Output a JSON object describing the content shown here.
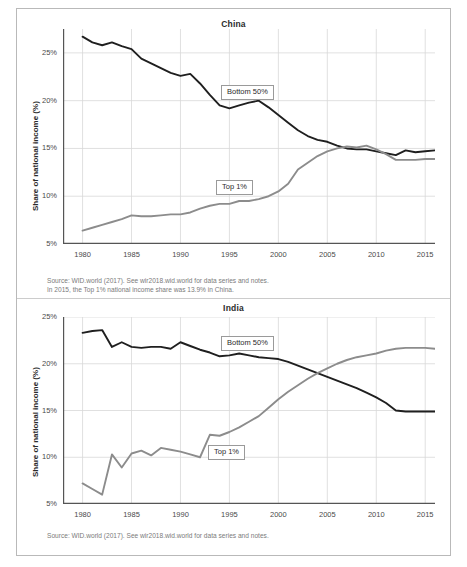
{
  "figure": {
    "background": "#ffffff",
    "border_color": "#b9b9b9"
  },
  "colors": {
    "bottom50": "#1f1f1f",
    "top1": "#8c8c8c",
    "grid": "#d8d8d8",
    "axis": "#555555",
    "text": "#3d3d3d",
    "source_text": "#7b7b7b"
  },
  "panels": {
    "china": {
      "title": "China",
      "ylabel": "Share of national income (%)",
      "source_line_1": "Source: WID.world (2017). See wir2018.wid.world for data series and notes.",
      "source_line_2": "In 2015, the Top 1% national income share was 13.9% in China.",
      "legend": {
        "bottom50": "Bottom 50%",
        "top1": "Top 1%"
      }
    },
    "india": {
      "title": "India",
      "ylabel": "Share of national income (%)",
      "source_line_1": "Source: WID.world (2017). See wir2018.wid.world for data series and notes.",
      "legend": {
        "bottom50": "Bottom 50%",
        "top1": "Top 1%"
      }
    }
  },
  "chart_data": [
    {
      "type": "line",
      "title": "China",
      "xlabel": "",
      "ylabel": "Share of national income (%)",
      "xlim": [
        1978,
        2016
      ],
      "ylim": [
        5,
        27.5
      ],
      "ytick_labels": [
        "5%",
        "10%",
        "15%",
        "20%",
        "25%"
      ],
      "ytick_values": [
        5,
        10,
        15,
        20,
        25
      ],
      "xtick_labels": [
        "1980",
        "1985",
        "1990",
        "1995",
        "2000",
        "2005",
        "2010",
        "2015"
      ],
      "xtick_values": [
        1980,
        1985,
        1990,
        1995,
        2000,
        2005,
        2010,
        2015
      ],
      "grid": true,
      "legend_position": "inline-labels",
      "annotations": [
        "Bottom 50%",
        "Top 1%"
      ],
      "x": [
        1980,
        1981,
        1982,
        1983,
        1984,
        1985,
        1986,
        1987,
        1988,
        1989,
        1990,
        1991,
        1992,
        1993,
        1994,
        1995,
        1996,
        1997,
        1998,
        1999,
        2000,
        2001,
        2002,
        2003,
        2004,
        2005,
        2006,
        2007,
        2008,
        2009,
        2010,
        2011,
        2012,
        2013,
        2014,
        2015,
        2016
      ],
      "series": [
        {
          "name": "Bottom 50%",
          "color": "#1f1f1f",
          "values": [
            26.7,
            26.1,
            25.8,
            26.1,
            25.7,
            25.4,
            24.4,
            23.9,
            23.4,
            22.9,
            22.6,
            22.8,
            21.8,
            20.6,
            19.5,
            19.2,
            19.5,
            19.8,
            20.0,
            19.3,
            18.5,
            17.7,
            16.9,
            16.3,
            15.9,
            15.7,
            15.3,
            15.0,
            14.9,
            14.9,
            14.7,
            14.5,
            14.3,
            14.8,
            14.6,
            14.7,
            14.8
          ]
        },
        {
          "name": "Top 1%",
          "color": "#8c8c8c",
          "values": [
            6.4,
            6.7,
            7.0,
            7.3,
            7.6,
            8.0,
            7.9,
            7.9,
            8.0,
            8.1,
            8.1,
            8.3,
            8.7,
            9.0,
            9.2,
            9.2,
            9.5,
            9.5,
            9.7,
            10.0,
            10.5,
            11.3,
            12.8,
            13.5,
            14.2,
            14.7,
            15.0,
            15.2,
            15.1,
            15.3,
            14.9,
            14.4,
            13.8,
            13.8,
            13.8,
            13.9,
            13.9
          ]
        }
      ]
    },
    {
      "type": "line",
      "title": "India",
      "xlabel": "",
      "ylabel": "Share of national income (%)",
      "xlim": [
        1978,
        2016
      ],
      "ylim": [
        5,
        25
      ],
      "ytick_labels": [
        "5%",
        "10%",
        "15%",
        "20%",
        "25%"
      ],
      "ytick_values": [
        5,
        10,
        15,
        20,
        25
      ],
      "xtick_labels": [
        "1980",
        "1985",
        "1990",
        "1995",
        "2000",
        "2005",
        "2010",
        "2015"
      ],
      "xtick_values": [
        1980,
        1985,
        1990,
        1995,
        2000,
        2005,
        2010,
        2015
      ],
      "grid": true,
      "legend_position": "inline-labels",
      "annotations": [
        "Bottom 50%",
        "Top 1%"
      ],
      "x": [
        1980,
        1981,
        1982,
        1983,
        1984,
        1985,
        1986,
        1987,
        1988,
        1989,
        1990,
        1991,
        1992,
        1993,
        1994,
        1995,
        1996,
        1997,
        1998,
        1999,
        2000,
        2001,
        2002,
        2003,
        2004,
        2005,
        2006,
        2007,
        2008,
        2009,
        2010,
        2011,
        2012,
        2013,
        2014,
        2015,
        2016
      ],
      "series": [
        {
          "name": "Bottom 50%",
          "color": "#1f1f1f",
          "values": [
            23.3,
            23.5,
            23.6,
            21.8,
            22.3,
            21.8,
            21.7,
            21.8,
            21.8,
            21.6,
            22.3,
            21.9,
            21.5,
            21.2,
            20.8,
            20.9,
            21.1,
            20.9,
            20.7,
            20.6,
            20.5,
            20.2,
            19.8,
            19.4,
            19.0,
            18.6,
            18.2,
            17.8,
            17.4,
            16.9,
            16.4,
            15.8,
            15.0,
            14.9,
            14.9,
            14.9,
            14.9
          ]
        },
        {
          "name": "Top 1%",
          "color": "#8c8c8c",
          "values": [
            7.2,
            6.6,
            6.0,
            10.3,
            8.9,
            10.4,
            10.7,
            10.2,
            11.0,
            10.8,
            10.6,
            10.3,
            10.0,
            12.4,
            12.3,
            12.7,
            13.2,
            13.8,
            14.4,
            15.3,
            16.2,
            17.0,
            17.7,
            18.4,
            19.0,
            19.5,
            20.0,
            20.4,
            20.7,
            20.9,
            21.1,
            21.4,
            21.6,
            21.7,
            21.7,
            21.7,
            21.6
          ]
        }
      ]
    }
  ]
}
